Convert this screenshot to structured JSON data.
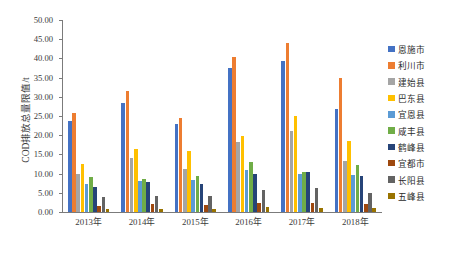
{
  "chart_data": {
    "type": "bar",
    "title": "",
    "xlabel": "",
    "ylabel": "COD排放总量限值/t",
    "ylim": [
      0,
      50
    ],
    "ytick_step": 5,
    "ytick_labels": [
      "50.00",
      "45.00",
      "40.00",
      "35.00",
      "30.00",
      "25.00",
      "20.00",
      "15.00",
      "10.00",
      "5.00",
      "0.00"
    ],
    "grid": false,
    "legend_position": "right",
    "categories": [
      "2013年",
      "2014年",
      "2015年",
      "2016年",
      "2017年",
      "2018年"
    ],
    "series": [
      {
        "name": "恩施市",
        "color": "#4472C4",
        "values": [
          23.7,
          28.5,
          22.9,
          37.5,
          39.2,
          26.9
        ]
      },
      {
        "name": "利川市",
        "color": "#ED7D31",
        "values": [
          25.9,
          31.4,
          24.6,
          40.4,
          44.1,
          35.0
        ]
      },
      {
        "name": "建始县",
        "color": "#A5A5A5",
        "values": [
          9.9,
          14.1,
          11.1,
          18.2,
          21.1,
          13.4
        ]
      },
      {
        "name": "巴东县",
        "color": "#FFC000",
        "values": [
          12.4,
          16.4,
          16.0,
          19.7,
          25.0,
          18.6
        ]
      },
      {
        "name": "宜恩县",
        "color": "#5B9BD5",
        "values": [
          7.3,
          8.2,
          8.3,
          10.9,
          9.9,
          9.6
        ]
      },
      {
        "name": "咸丰县",
        "color": "#70AD47",
        "values": [
          9.0,
          8.7,
          9.4,
          13.0,
          10.5,
          12.3
        ]
      },
      {
        "name": "鹤峰县",
        "color": "#264478",
        "values": [
          6.5,
          7.8,
          7.3,
          10.0,
          10.4,
          9.5
        ]
      },
      {
        "name": "宜都市",
        "color": "#9E480E",
        "values": [
          1.6,
          2.1,
          1.7,
          2.3,
          2.4,
          2.1
        ]
      },
      {
        "name": "长阳县",
        "color": "#636363",
        "values": [
          3.9,
          4.2,
          4.1,
          5.8,
          6.2,
          5.0
        ]
      },
      {
        "name": "五峰县",
        "color": "#997300",
        "values": [
          0.7,
          0.9,
          0.8,
          1.2,
          1.1,
          1.0
        ]
      }
    ]
  },
  "axis": {
    "y_title": "COD排放总量限值/t"
  }
}
